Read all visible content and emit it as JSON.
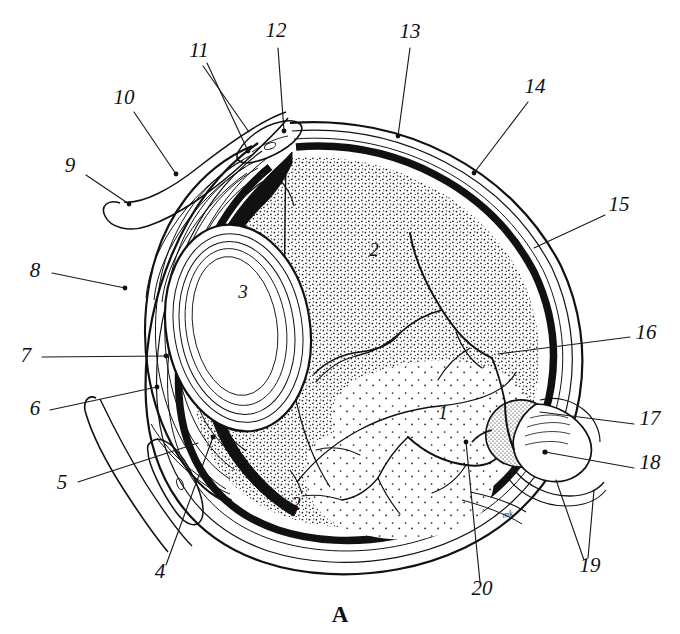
{
  "figure": {
    "caption": "A",
    "artist_monogram": "mk",
    "background_color": "#ffffff",
    "ink_color": "#111111",
    "width": 680,
    "height": 634
  },
  "labels": [
    {
      "id": "1",
      "text": "1",
      "x": 443,
      "y": 419,
      "kind": "inner",
      "anchor": "middle"
    },
    {
      "id": "2a",
      "text": "2",
      "x": 374,
      "y": 256,
      "kind": "inner",
      "anchor": "middle"
    },
    {
      "id": "2b",
      "text": "2",
      "x": 296,
      "y": 510,
      "kind": "inner",
      "anchor": "middle"
    },
    {
      "id": "3",
      "text": "3",
      "x": 243,
      "y": 298,
      "kind": "inner",
      "anchor": "middle"
    },
    {
      "id": "4",
      "text": "4",
      "x": 160,
      "y": 578,
      "kind": "outer",
      "anchor": "middle"
    },
    {
      "id": "5",
      "text": "5",
      "x": 62,
      "y": 489,
      "kind": "outer",
      "anchor": "middle"
    },
    {
      "id": "6",
      "text": "6",
      "x": 35,
      "y": 415,
      "kind": "outer",
      "anchor": "middle"
    },
    {
      "id": "7",
      "text": "7",
      "x": 26,
      "y": 362,
      "kind": "outer",
      "anchor": "middle"
    },
    {
      "id": "8",
      "text": "8",
      "x": 35,
      "y": 277,
      "kind": "outer",
      "anchor": "middle"
    },
    {
      "id": "9",
      "text": "9",
      "x": 70,
      "y": 172,
      "kind": "outer",
      "anchor": "middle"
    },
    {
      "id": "10",
      "text": "10",
      "x": 124,
      "y": 104,
      "kind": "outer",
      "anchor": "middle"
    },
    {
      "id": "11",
      "text": "11",
      "x": 199,
      "y": 57,
      "kind": "outer",
      "anchor": "middle"
    },
    {
      "id": "12",
      "text": "12",
      "x": 276,
      "y": 37,
      "kind": "outer",
      "anchor": "middle"
    },
    {
      "id": "13",
      "text": "13",
      "x": 410,
      "y": 38,
      "kind": "outer",
      "anchor": "middle"
    },
    {
      "id": "14",
      "text": "14",
      "x": 535,
      "y": 93,
      "kind": "outer",
      "anchor": "middle"
    },
    {
      "id": "15",
      "text": "15",
      "x": 619,
      "y": 211,
      "kind": "outer",
      "anchor": "middle"
    },
    {
      "id": "16",
      "text": "16",
      "x": 646,
      "y": 339,
      "kind": "outer",
      "anchor": "middle"
    },
    {
      "id": "17",
      "text": "17",
      "x": 650,
      "y": 425,
      "kind": "outer",
      "anchor": "middle"
    },
    {
      "id": "18",
      "text": "18",
      "x": 650,
      "y": 469,
      "kind": "outer",
      "anchor": "middle"
    },
    {
      "id": "19",
      "text": "19",
      "x": 590,
      "y": 572,
      "kind": "outer",
      "anchor": "middle"
    },
    {
      "id": "20",
      "text": "20",
      "x": 482,
      "y": 595,
      "kind": "outer",
      "anchor": "middle"
    }
  ],
  "structures": [
    {
      "key": "vitreous-body",
      "label_ref": "1"
    },
    {
      "key": "retina",
      "label_ref": "2"
    },
    {
      "key": "lens",
      "label_ref": "3"
    },
    {
      "key": "ciliary-body",
      "label_ref": "4"
    },
    {
      "key": "lower-eyelid",
      "label_ref": "5"
    },
    {
      "key": "anterior-chamber",
      "label_ref": "6"
    },
    {
      "key": "cornea",
      "label_ref": "7"
    },
    {
      "key": "corneal-limbus",
      "label_ref": "8"
    },
    {
      "key": "upper-eyelid",
      "label_ref": "9"
    },
    {
      "key": "conjunctiva",
      "label_ref": "10"
    },
    {
      "key": "superior-fornix",
      "label_ref": "11"
    },
    {
      "key": "tarsal-plate",
      "label_ref": "12"
    },
    {
      "key": "sclera",
      "label_ref": "13"
    },
    {
      "key": "choroid",
      "label_ref": "14"
    },
    {
      "key": "pigment-layer",
      "label_ref": "15"
    },
    {
      "key": "retinal-vessel",
      "label_ref": "16"
    },
    {
      "key": "optic-disc",
      "label_ref": "17"
    },
    {
      "key": "optic-nerve",
      "label_ref": "18"
    },
    {
      "key": "nerve-sheath",
      "label_ref": "19"
    },
    {
      "key": "central-vessels",
      "label_ref": "20"
    }
  ]
}
